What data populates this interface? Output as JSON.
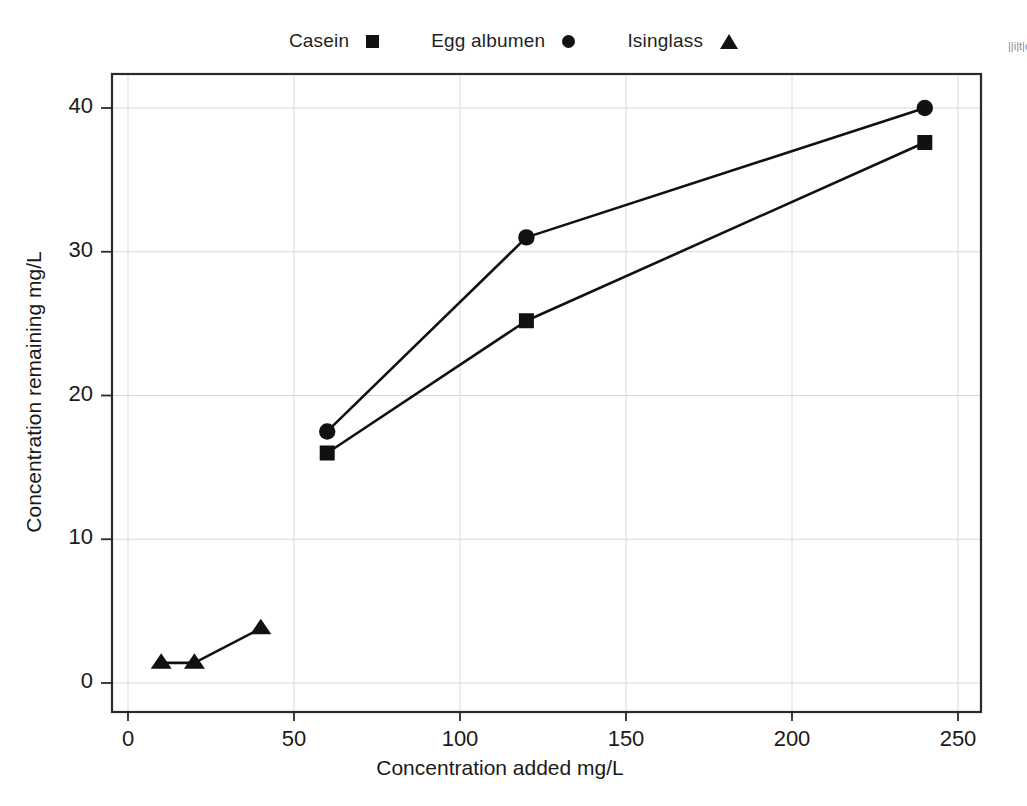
{
  "chart_data": {
    "type": "line",
    "title": "",
    "xlabel": "Concentration added mg/L",
    "ylabel": "Concentration remaining mg/L",
    "xlim": [
      0,
      258
    ],
    "ylim": [
      -1.5,
      43.5
    ],
    "xticks": [
      0,
      50,
      100,
      150,
      200,
      250
    ],
    "xticklabels": [
      "0",
      "50",
      "100",
      "150",
      "200",
      "250"
    ],
    "yticks": [
      0,
      10,
      20,
      30,
      40
    ],
    "yticklabels": [
      "0",
      "10",
      "20",
      "30",
      "40"
    ],
    "grid": true,
    "grid_color": "#d9d9d9",
    "legend_position": "top-center",
    "marker_color": "#111111",
    "line_color": "#111111",
    "series": [
      {
        "name": "Casein",
        "marker": "square",
        "x": [
          60,
          120,
          240
        ],
        "values": [
          16.0,
          25.2,
          37.6
        ]
      },
      {
        "name": "Egg albumen",
        "marker": "circle",
        "x": [
          60,
          120,
          240
        ],
        "values": [
          17.5,
          31.0,
          40.0
        ]
      },
      {
        "name": "Isinglass",
        "marker": "triangle",
        "x": [
          10,
          20,
          40
        ],
        "values": [
          1.4,
          1.4,
          3.8
        ]
      }
    ]
  },
  "legend": {
    "entries": [
      {
        "label": "Casein",
        "marker": "square"
      },
      {
        "label": "Egg albumen",
        "marker": "circle"
      },
      {
        "label": "Isinglass",
        "marker": "triangle"
      }
    ]
  },
  "axes": {
    "x_title": "Concentration added mg/L",
    "y_title": "Concentration remaining mg/L"
  },
  "margin_note": "||i|t|c"
}
